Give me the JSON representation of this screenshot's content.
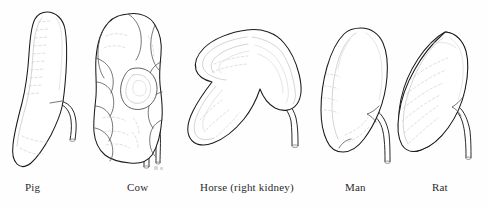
{
  "figure": {
    "background_color": "#fefefe",
    "outline_color": "#1a1a1a",
    "detail_color": "#b7b7b7",
    "label_color": "#2b2b2b",
    "width": 487,
    "height": 207
  },
  "specimens": [
    {
      "id": "pig",
      "label": "Pig",
      "label_x": 25,
      "label_y": 187,
      "shape": "elongated smooth bean",
      "ureter": "mid-lateral, descending"
    },
    {
      "id": "cow",
      "label": "Cow",
      "label_x": 127,
      "label_y": 187,
      "shape": "multilobulated",
      "ureter": "central hilum, descending"
    },
    {
      "id": "horse",
      "label": "Horse (right kidney)",
      "label_x": 200,
      "label_y": 187,
      "shape": "broad heart-shaped",
      "ureter": "lower lateral, descending"
    },
    {
      "id": "man",
      "label": "Man",
      "label_x": 345,
      "label_y": 187,
      "shape": "classic bean",
      "ureter": "lower medial, descending"
    },
    {
      "id": "rat",
      "label": "Rat",
      "label_x": 432,
      "label_y": 187,
      "shape": "smooth ovoid",
      "ureter": "lower medial, descending"
    }
  ]
}
